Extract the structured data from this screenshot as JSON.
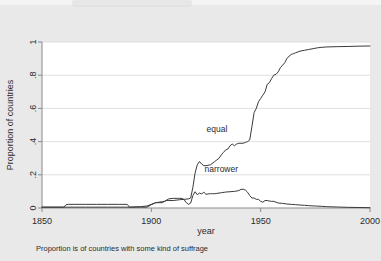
{
  "figure": {
    "background_color": "#e9e9e9",
    "plot_background_color": "#ffffff",
    "line_color": "#3a3a3a",
    "grid_color": "#d8d8d8",
    "axis_color": "#8a8a8a"
  },
  "chart_data": {
    "type": "line",
    "title": "",
    "subtitle": "",
    "xlabel": "year",
    "ylabel": "Proportion of countries",
    "caption": "Proportion is of countries with some kind of suffrage",
    "xlim": [
      1850,
      2000
    ],
    "ylim": [
      0,
      1
    ],
    "xticks": [
      1850,
      1900,
      1950,
      2000
    ],
    "xtick_labels": [
      "1850",
      "1900",
      "1950",
      "2000"
    ],
    "yticks": [
      0,
      0.2,
      0.4,
      0.6,
      0.8,
      1
    ],
    "ytick_labels": [
      "0",
      ".2",
      ".4",
      ".6",
      ".8",
      "1"
    ],
    "grid": "horizontal",
    "legend_position": "inline-annotations",
    "annotations": [
      {
        "text": "equal",
        "x": 1930,
        "y": 0.455
      },
      {
        "text": "narrower",
        "x": 1932,
        "y": 0.215
      }
    ],
    "series": [
      {
        "name": "equal",
        "label": "equal",
        "x": [
          1850,
          1855,
          1860,
          1861,
          1862,
          1865,
          1870,
          1875,
          1880,
          1885,
          1889,
          1890,
          1893,
          1895,
          1898,
          1900,
          1902,
          1905,
          1906,
          1907,
          1908,
          1910,
          1913,
          1915,
          1917,
          1918,
          1919,
          1920,
          1921,
          1922,
          1923,
          1924,
          1925,
          1927,
          1929,
          1930,
          1931,
          1932,
          1933,
          1934,
          1935,
          1936,
          1937,
          1938,
          1939,
          1940,
          1941,
          1942,
          1943,
          1944,
          1945,
          1946,
          1947,
          1948,
          1949,
          1950,
          1951,
          1952,
          1953,
          1954,
          1955,
          1956,
          1957,
          1958,
          1959,
          1960,
          1961,
          1962,
          1963,
          1964,
          1965,
          1966,
          1968,
          1970,
          1972,
          1974,
          1976,
          1978,
          1980,
          1985,
          1990,
          1995,
          2000
        ],
        "y": [
          0.005,
          0.005,
          0.005,
          0.02,
          0.022,
          0.022,
          0.022,
          0.022,
          0.022,
          0.022,
          0.022,
          0.005,
          0.005,
          0.005,
          0.005,
          0.02,
          0.032,
          0.032,
          0.04,
          0.045,
          0.045,
          0.045,
          0.05,
          0.052,
          0.055,
          0.06,
          0.125,
          0.21,
          0.26,
          0.28,
          0.265,
          0.255,
          0.255,
          0.26,
          0.28,
          0.29,
          0.3,
          0.32,
          0.335,
          0.35,
          0.355,
          0.375,
          0.385,
          0.375,
          0.385,
          0.39,
          0.39,
          0.39,
          0.395,
          0.4,
          0.41,
          0.49,
          0.575,
          0.6,
          0.64,
          0.66,
          0.68,
          0.7,
          0.745,
          0.755,
          0.78,
          0.8,
          0.805,
          0.82,
          0.845,
          0.86,
          0.875,
          0.9,
          0.915,
          0.925,
          0.93,
          0.935,
          0.945,
          0.95,
          0.955,
          0.96,
          0.965,
          0.968,
          0.97,
          0.972,
          0.973,
          0.975,
          0.976
        ]
      },
      {
        "name": "narrower",
        "label": "narrower",
        "x": [
          1850,
          1860,
          1870,
          1880,
          1890,
          1895,
          1898,
          1900,
          1902,
          1905,
          1906,
          1908,
          1910,
          1912,
          1913,
          1914,
          1915,
          1916,
          1917,
          1918,
          1919,
          1920,
          1921,
          1922,
          1923,
          1924,
          1925,
          1926,
          1927,
          1928,
          1929,
          1930,
          1932,
          1934,
          1936,
          1938,
          1940,
          1941,
          1942,
          1943,
          1944,
          1945,
          1946,
          1947,
          1948,
          1949,
          1950,
          1951,
          1952,
          1953,
          1954,
          1955,
          1956,
          1957,
          1958,
          1960,
          1962,
          1964,
          1966,
          1968,
          1970,
          1972,
          1975,
          1978,
          1980,
          1985,
          1990,
          1995,
          2000
        ],
        "y": [
          0.005,
          0.005,
          0.005,
          0.005,
          0.005,
          0.008,
          0.012,
          0.022,
          0.032,
          0.038,
          0.04,
          0.055,
          0.058,
          0.058,
          0.058,
          0.058,
          0.05,
          0.032,
          0.022,
          0.03,
          0.075,
          0.098,
          0.08,
          0.09,
          0.085,
          0.095,
          0.082,
          0.085,
          0.086,
          0.086,
          0.086,
          0.088,
          0.092,
          0.096,
          0.098,
          0.1,
          0.105,
          0.112,
          0.113,
          0.108,
          0.095,
          0.075,
          0.06,
          0.06,
          0.052,
          0.052,
          0.04,
          0.035,
          0.045,
          0.045,
          0.042,
          0.04,
          0.04,
          0.035,
          0.03,
          0.028,
          0.024,
          0.022,
          0.02,
          0.018,
          0.016,
          0.014,
          0.012,
          0.01,
          0.008,
          0.006,
          0.004,
          0.003,
          0.002
        ]
      }
    ]
  }
}
